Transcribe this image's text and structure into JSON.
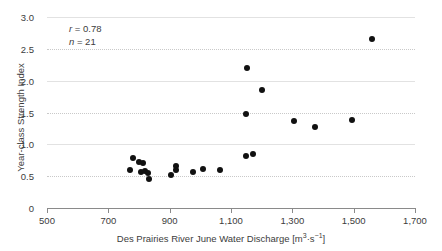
{
  "chart_data": {
    "type": "scatter",
    "title": "",
    "xlabel": "Des Prairies River June Water Discharge [m³·s⁻¹]",
    "ylabel": "Year-class Strength Index",
    "xlim": [
      500,
      1700
    ],
    "ylim": [
      0,
      3.0
    ],
    "xticks": [
      500,
      700,
      900,
      1100,
      1300,
      1500,
      1700
    ],
    "xtick_labels": [
      "500",
      "700",
      "900",
      "1,100",
      "1,300",
      "1,500",
      "1,700"
    ],
    "yticks": [
      0,
      0.5,
      1.0,
      1.5,
      2.0,
      2.5,
      3.0
    ],
    "ytick_labels": [
      "0",
      "0.5",
      "1.0",
      "1.5",
      "2.0",
      "2.5",
      "3.0"
    ],
    "grid": true,
    "legend": "none",
    "marker_color": "#111111",
    "points": [
      {
        "x": 770,
        "y": 0.6
      },
      {
        "x": 782,
        "y": 0.78
      },
      {
        "x": 800,
        "y": 0.72
      },
      {
        "x": 806,
        "y": 0.56
      },
      {
        "x": 812,
        "y": 0.7
      },
      {
        "x": 818,
        "y": 0.58
      },
      {
        "x": 830,
        "y": 0.55
      },
      {
        "x": 832,
        "y": 0.46
      },
      {
        "x": 905,
        "y": 0.52
      },
      {
        "x": 920,
        "y": 0.66
      },
      {
        "x": 922,
        "y": 0.6
      },
      {
        "x": 975,
        "y": 0.57
      },
      {
        "x": 1010,
        "y": 0.62
      },
      {
        "x": 1065,
        "y": 0.6
      },
      {
        "x": 1148,
        "y": 1.48
      },
      {
        "x": 1150,
        "y": 0.82
      },
      {
        "x": 1172,
        "y": 0.85
      },
      {
        "x": 1152,
        "y": 2.2
      },
      {
        "x": 1200,
        "y": 1.86
      },
      {
        "x": 1305,
        "y": 1.37
      },
      {
        "x": 1375,
        "y": 1.27
      },
      {
        "x": 1495,
        "y": 1.38
      },
      {
        "x": 1560,
        "y": 2.66
      }
    ]
  },
  "annotation": {
    "correlation_symbol": "r",
    "correlation_value": "= 0.78",
    "sample_symbol": "n",
    "sample_value": "= 21"
  },
  "axis": {
    "xlabel_prefix": "Des Prairies River June Water Discharge [m",
    "xlabel_sup1": "3",
    "xlabel_mid": "·s",
    "xlabel_sup2": "−1",
    "xlabel_suffix": "]",
    "ylabel": "Year-class Strength Index"
  }
}
